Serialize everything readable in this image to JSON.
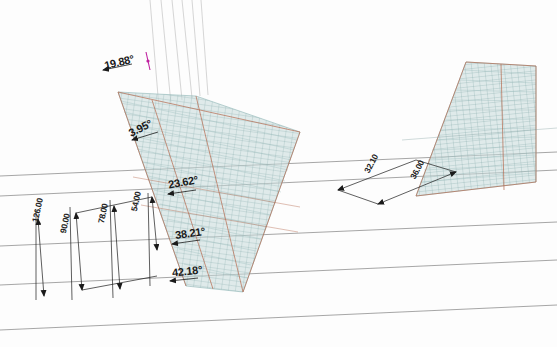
{
  "view": {
    "title": "CAD Dimension View",
    "background_color": "#fdfdfd",
    "ground_line_color": "#8c8c8c",
    "mesh_fill_color": "#bdd4d4",
    "mesh_line_color": "#7fa8a8",
    "mesh_edge_color": "#b4654a",
    "dimension_line_color": "#1a1a1a",
    "guide_line_color": "#c9c9c9",
    "magenta_marker_color": "#c020a0"
  },
  "angle_dimensions": [
    {
      "id": "angle-1",
      "value": "19.88°",
      "x": 104,
      "y": 56,
      "rotation": -14
    },
    {
      "id": "angle-2",
      "value": "3.95°",
      "x": 128,
      "y": 122,
      "rotation": -26
    },
    {
      "id": "angle-3",
      "value": "23.62°",
      "x": 168,
      "y": 176,
      "rotation": -10
    },
    {
      "id": "angle-4",
      "value": "38.21°",
      "x": 175,
      "y": 227,
      "rotation": -8
    },
    {
      "id": "angle-5",
      "value": "42.18°",
      "x": 172,
      "y": 265,
      "rotation": -6
    }
  ],
  "linear_dimensions_left": [
    {
      "id": "linear-126",
      "value": "126.00",
      "x": 30,
      "y": 221,
      "rotation": -78
    },
    {
      "id": "linear-90",
      "value": "90.00",
      "x": 58,
      "y": 232,
      "rotation": -78
    },
    {
      "id": "linear-78",
      "value": "78.00",
      "x": 96,
      "y": 222,
      "rotation": -78
    },
    {
      "id": "linear-54",
      "value": "54.00",
      "x": 129,
      "y": 210,
      "rotation": -78
    }
  ],
  "linear_dimensions_right": [
    {
      "id": "linear-r1",
      "value": "32.10",
      "x": 362,
      "y": 170,
      "rotation": -62
    },
    {
      "id": "linear-r2",
      "value": "36.00",
      "x": 408,
      "y": 176,
      "rotation": -62
    }
  ],
  "structures": [
    {
      "id": "mesh-left",
      "label": "left-wireframe-surface"
    },
    {
      "id": "mesh-right",
      "label": "right-wireframe-surface"
    }
  ]
}
